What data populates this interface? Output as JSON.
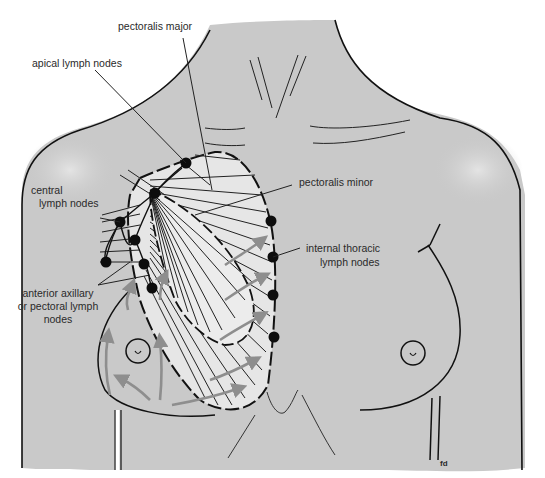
{
  "diagram": {
    "colors": {
      "skin": "#c9c9c9",
      "skin_highlight": "#e2e2e2",
      "muscle_fill": "#e6e6e6",
      "outline": "#111111",
      "arrow": "#8e8e8e",
      "node": "#0d0d0d",
      "background": "#ffffff"
    },
    "labels": {
      "pectoralis_major": "pectoralis major",
      "apical_nodes": "apical lymph nodes",
      "central_nodes_line1": "central",
      "central_nodes_line2": "lymph nodes",
      "pectoralis_minor": "pectoralis minor",
      "internal_thoracic_line1": "internal thoracic",
      "internal_thoracic_line2": "lymph nodes",
      "anterior_axillary_line1": "anterior axillary",
      "anterior_axillary_line2": "or pectoral lymph",
      "anterior_axillary_line3": "nodes",
      "signature": "fd"
    },
    "node_groups": [
      {
        "name": "apical",
        "count": 1
      },
      {
        "name": "central",
        "count": 3
      },
      {
        "name": "anterior-axillary",
        "count": 3
      },
      {
        "name": "internal-thoracic",
        "count": 4
      }
    ]
  }
}
